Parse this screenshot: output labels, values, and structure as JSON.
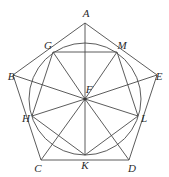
{
  "figure": {
    "width": 169,
    "height": 177,
    "background_color": "#ffffff",
    "stroke_color": "#4a4a4a",
    "label_color": "#2b2b2b",
    "stroke_width": 0.9,
    "circle": {
      "center_x": 85,
      "center_y": 99,
      "radius": 56
    },
    "outer_pentagon": {
      "name": "ABCDE",
      "vertices": [
        {
          "id": "A",
          "x": 85,
          "y": 23,
          "label_x": 86,
          "label_y": 13
        },
        {
          "id": "B",
          "x": 13,
          "y": 75,
          "label_x": 11,
          "label_y": 76
        },
        {
          "id": "C",
          "x": 41,
          "y": 160,
          "label_x": 38,
          "label_y": 168
        },
        {
          "id": "D",
          "x": 129,
          "y": 160,
          "label_x": 132,
          "label_y": 168
        },
        {
          "id": "E",
          "x": 157,
          "y": 75,
          "label_x": 159,
          "label_y": 76
        }
      ]
    },
    "inner_pentagon": {
      "name": "GMLKH",
      "vertices": [
        {
          "id": "G",
          "x": 53,
          "y": 52,
          "label_x": 48,
          "label_y": 45
        },
        {
          "id": "M",
          "x": 117,
          "y": 52,
          "label_x": 122,
          "label_y": 45
        },
        {
          "id": "L",
          "x": 138,
          "y": 116,
          "label_x": 144,
          "label_y": 118
        },
        {
          "id": "K",
          "x": 85,
          "y": 155,
          "label_x": 85,
          "label_y": 165
        },
        {
          "id": "H",
          "x": 32,
          "y": 116,
          "label_x": 26,
          "label_y": 118
        }
      ]
    },
    "center": {
      "id": "F",
      "x": 85,
      "y": 99,
      "label_x": 89,
      "label_y": 89
    },
    "spokes_from_center": [
      "A",
      "B",
      "C",
      "D",
      "E",
      "G",
      "M",
      "L",
      "K",
      "H"
    ],
    "caption": ""
  }
}
